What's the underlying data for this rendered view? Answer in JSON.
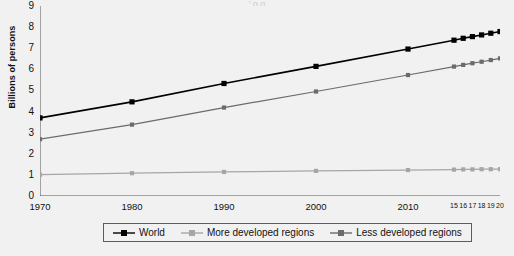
{
  "title_fragment": "  '     o        o  ",
  "chart_data": {
    "type": "line",
    "title": "",
    "xlabel": "",
    "ylabel": "Billions of persons",
    "xlim": [
      1970,
      2020
    ],
    "ylim": [
      0,
      9
    ],
    "grid": false,
    "legend_position": "bottom",
    "x": [
      1970,
      1980,
      1990,
      2000,
      2010,
      2015,
      2016,
      2017,
      2018,
      2019,
      2020
    ],
    "xtick_labels": [
      "1970",
      "1980",
      "1990",
      "2000",
      "2010",
      "15",
      "16",
      "17",
      "18",
      "19",
      "20"
    ],
    "xtick_major": [
      "1970",
      "1980",
      "1990",
      "2000",
      "2010"
    ],
    "xtick_minor": [
      "15",
      "16",
      "17",
      "18",
      "19",
      "20"
    ],
    "ytick_labels": [
      "0",
      "1",
      "2",
      "3",
      "4",
      "5",
      "6",
      "7",
      "8",
      "9"
    ],
    "ytick_values": [
      0,
      1,
      2,
      3,
      4,
      5,
      6,
      7,
      8,
      9
    ],
    "series": [
      {
        "name": "World",
        "color": "#000000",
        "marker": "square",
        "values": [
          3.7,
          4.46,
          5.33,
          6.14,
          6.96,
          7.38,
          7.47,
          7.55,
          7.63,
          7.71,
          7.79
        ]
      },
      {
        "name": "More developed regions",
        "color": "#a6a6a6",
        "marker": "square",
        "values": [
          1.01,
          1.08,
          1.14,
          1.19,
          1.23,
          1.25,
          1.26,
          1.26,
          1.27,
          1.27,
          1.27
        ]
      },
      {
        "name": "Less developed regions",
        "color": "#6b6b6b",
        "marker": "square",
        "values": [
          2.69,
          3.38,
          4.19,
          4.95,
          5.73,
          6.13,
          6.21,
          6.29,
          6.36,
          6.44,
          6.52
        ]
      }
    ]
  },
  "legend": {
    "items": [
      {
        "label": "World",
        "color": "#000000"
      },
      {
        "label": "More developed regions",
        "color": "#a6a6a6"
      },
      {
        "label": "Less developed regions",
        "color": "#6b6b6b"
      }
    ]
  },
  "axis": {
    "line_color": "#555555"
  }
}
